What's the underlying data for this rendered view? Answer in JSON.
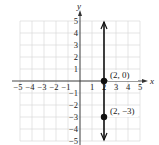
{
  "chart_data": {
    "type": "line",
    "title": "",
    "xlabel": "x",
    "ylabel": "y",
    "xlim": [
      -5,
      5
    ],
    "ylim": [
      -5,
      5
    ],
    "grid": true,
    "x_ticks": [
      "-5",
      "-4",
      "-3",
      "-2",
      "-1",
      "1",
      "2",
      "3",
      "4",
      "5"
    ],
    "y_ticks": [
      "5",
      "4",
      "3",
      "2",
      "1",
      "-1",
      "-2",
      "-3",
      "-4",
      "-5"
    ],
    "series": [
      {
        "name": "x = 2",
        "kind": "vertical line with arrows at both ends",
        "x": [
          2,
          2
        ],
        "y": [
          -5,
          5
        ]
      }
    ],
    "points": [
      {
        "x": 2,
        "y": 0,
        "label": "(2, 0)"
      },
      {
        "x": 2,
        "y": -3,
        "label": "(2, −3)"
      }
    ],
    "colors": {
      "line": "#111111",
      "grid": "#d4d4d4",
      "axis": "#333333"
    }
  }
}
